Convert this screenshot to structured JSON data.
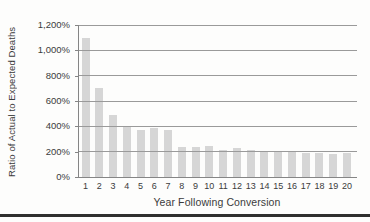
{
  "chart_data": {
    "type": "bar",
    "title": "",
    "xlabel": "Year Following Conversion",
    "ylabel": "Ratio of Actual to Expected Deaths",
    "categories": [
      "1",
      "2",
      "3",
      "4",
      "5",
      "6",
      "7",
      "8",
      "9",
      "10",
      "11",
      "12",
      "13",
      "14",
      "15",
      "16",
      "17",
      "18",
      "19",
      "20"
    ],
    "values": [
      1100,
      700,
      490,
      405,
      375,
      390,
      370,
      235,
      240,
      245,
      210,
      230,
      210,
      205,
      200,
      195,
      190,
      190,
      185,
      190
    ],
    "ylim": [
      0,
      1200
    ],
    "ytick_step": 200,
    "ytick_labels": [
      "0%",
      "200%",
      "400%",
      "600%",
      "800%",
      "1,000%",
      "1,200%"
    ],
    "grid": true,
    "legend": "none",
    "colors": {
      "bar": "#d6d6d6",
      "gridline": "#9a9a9a",
      "axis": "#858585",
      "text": "#3b3b3b",
      "page_rule": "#2f2f2f",
      "background": "#fdfdfc"
    }
  }
}
